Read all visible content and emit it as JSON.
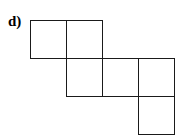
{
  "label": "d)",
  "grid": {
    "origin_x": 30,
    "origin_y": 20,
    "cell_w": 36,
    "cell_h": 38,
    "line_color": "#1a1a1a"
  },
  "cells": [
    {
      "row": 0,
      "col": 0
    },
    {
      "row": 0,
      "col": 1
    },
    {
      "row": 1,
      "col": 1
    },
    {
      "row": 1,
      "col": 2
    },
    {
      "row": 1,
      "col": 3
    },
    {
      "row": 2,
      "col": 3
    }
  ]
}
